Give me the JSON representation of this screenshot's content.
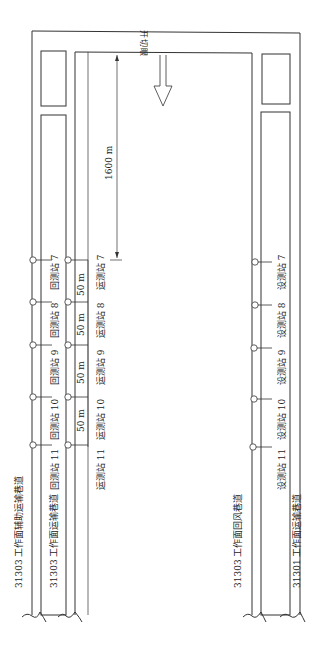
{
  "diagram": {
    "type": "mine roadway layout with survey stations",
    "cut_label": {
      "chars": [
        "开",
        "切",
        "眼"
      ]
    },
    "distance_label": "1600 m",
    "spacing_labels": [
      "50 m",
      "50 m",
      "50 m",
      "50 m"
    ],
    "roadways": [
      {
        "id": "left-outer",
        "label": "31303 工作面辅助运输巷道"
      },
      {
        "id": "left-inner",
        "label": "31303 工作面运输巷道"
      },
      {
        "id": "right-inner",
        "label": "31303 工作面回风巷道"
      },
      {
        "id": "right-outer",
        "label": "31301 工作面运输巷道"
      }
    ],
    "stations": {
      "return": [
        {
          "label": "回测站 7"
        },
        {
          "label": "回测站 8"
        },
        {
          "label": "回测站 9"
        },
        {
          "label": "回测站 10"
        },
        {
          "label": "回测站 11"
        }
      ],
      "transport": [
        {
          "label": "运测站 7"
        },
        {
          "label": "运测站 8"
        },
        {
          "label": "运测站 9"
        },
        {
          "label": "运测站 10"
        },
        {
          "label": "运测站 11"
        }
      ],
      "design": [
        {
          "label": "设测站 7"
        },
        {
          "label": "设测站 8"
        },
        {
          "label": "设测站 9"
        },
        {
          "label": "设测站 10"
        },
        {
          "label": "设测站 11"
        }
      ]
    },
    "colors": {
      "line": "#333333",
      "background": "#ffffff"
    }
  }
}
